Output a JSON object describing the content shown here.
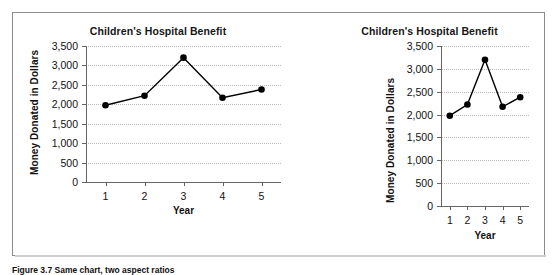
{
  "figure": {
    "caption": "Figure 3.7  Same chart, two  aspect ratios"
  },
  "charts": [
    {
      "id": "chart-wide",
      "title": "Children's Hospital Benefit",
      "ylabel": "Money Donated in Dollars",
      "xlabel": "Year",
      "yticks": [
        "3,500",
        "3,000",
        "2,500",
        "2,000",
        "1,500",
        "1,000",
        "500",
        "0"
      ],
      "xticks": [
        "1",
        "2",
        "3",
        "4",
        "5"
      ]
    },
    {
      "id": "chart-narrow",
      "title": "Children's Hospital Benefit",
      "ylabel": "Money Donated in Dollars",
      "xlabel": "Year",
      "yticks": [
        "3,500",
        "3,000",
        "2,500",
        "2,000",
        "1,500",
        "1,000",
        "500",
        "0"
      ],
      "xticks": [
        "1",
        "2",
        "3",
        "4",
        "5"
      ]
    }
  ],
  "chart_data": [
    {
      "type": "line",
      "title": "Children's Hospital Benefit",
      "xlabel": "Year",
      "ylabel": "Money Donated in Dollars",
      "x": [
        1,
        2,
        3,
        4,
        5
      ],
      "categories": [
        "1",
        "2",
        "3",
        "4",
        "5"
      ],
      "values": [
        1975,
        2220,
        3200,
        2170,
        2380
      ],
      "ylim": [
        0,
        3500
      ],
      "xlim": [
        0.5,
        5.5
      ],
      "ytick_values": [
        0,
        500,
        1000,
        1500,
        2000,
        2500,
        3000,
        3500
      ],
      "grid": true,
      "legend": "none",
      "marker": "filled-circle",
      "line_color": "#000000",
      "aspect": "wide"
    },
    {
      "type": "line",
      "title": "Children's Hospital Benefit",
      "xlabel": "Year",
      "ylabel": "Money Donated in Dollars",
      "x": [
        1,
        2,
        3,
        4,
        5
      ],
      "categories": [
        "1",
        "2",
        "3",
        "4",
        "5"
      ],
      "values": [
        1975,
        2220,
        3200,
        2170,
        2380
      ],
      "ylim": [
        0,
        3500
      ],
      "xlim": [
        0.5,
        5.5
      ],
      "ytick_values": [
        0,
        500,
        1000,
        1500,
        2000,
        2500,
        3000,
        3500
      ],
      "grid": true,
      "legend": "none",
      "marker": "filled-circle",
      "line_color": "#000000",
      "aspect": "narrow"
    }
  ]
}
